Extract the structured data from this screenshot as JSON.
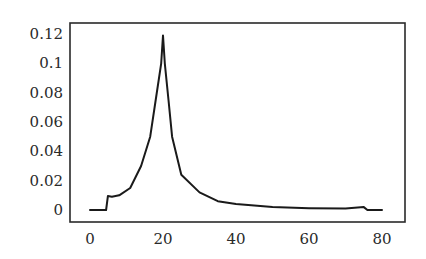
{
  "chart_data": {
    "type": "line",
    "title": "",
    "xlabel": "",
    "ylabel": "",
    "xlim": [
      -5,
      85
    ],
    "ylim": [
      -0.008,
      0.12
    ],
    "grid": false,
    "legend": null,
    "x_ticks": [
      0,
      20,
      40,
      60,
      80
    ],
    "x_tick_labels": [
      "0",
      "20",
      "40",
      "60",
      "80"
    ],
    "y_ticks": [
      0,
      0.02,
      0.04,
      0.06,
      0.08,
      0.1,
      0.12
    ],
    "y_tick_labels": [
      "0",
      "0.02",
      "0.04",
      "0.06",
      "0.08",
      "0.1",
      "0.12"
    ],
    "series": [
      {
        "name": "curve",
        "color": "#1a1a1a",
        "x": [
          0,
          4.4,
          4.9,
          6,
          8,
          11,
          14,
          16.5,
          18,
          19.5,
          20,
          20.5,
          21.5,
          22.5,
          25,
          30,
          35,
          40,
          50,
          60,
          70,
          75,
          76,
          80
        ],
        "y": [
          0,
          0,
          0.0095,
          0.009,
          0.01,
          0.015,
          0.03,
          0.05,
          0.075,
          0.1,
          0.119,
          0.1,
          0.075,
          0.05,
          0.024,
          0.012,
          0.006,
          0.004,
          0.002,
          0.0012,
          0.001,
          0.002,
          0,
          0
        ]
      }
    ]
  }
}
